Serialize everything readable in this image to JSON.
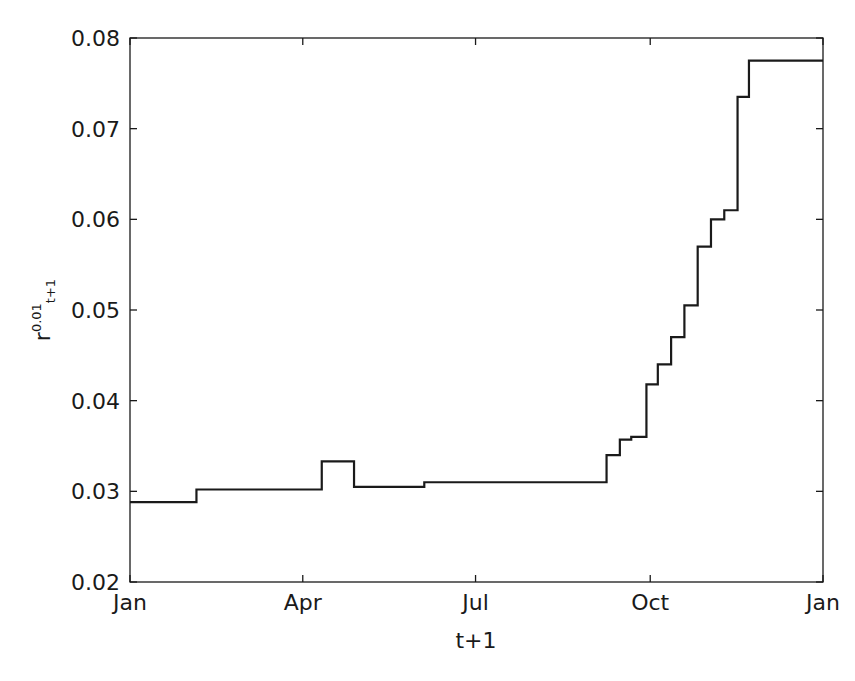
{
  "chart_data": {
    "type": "line",
    "title": "",
    "subtitle": "",
    "xlabel": "t+1",
    "ylabel": "r",
    "ylabel_superscript": "0.01",
    "ylabel_subscript": "t+1",
    "line_color": "#1a1a1a",
    "line_width": 2.2,
    "grid": false,
    "legend": null,
    "drawstyle": "steps-post",
    "xlim": [
      0,
      365
    ],
    "ylim": [
      0.02,
      0.08
    ],
    "xticks": [
      0,
      91,
      182,
      274,
      365
    ],
    "xticklabels": [
      "Jan",
      "Apr",
      "Jul",
      "Oct",
      "Jan"
    ],
    "yticks": [
      0.02,
      0.03,
      0.04,
      0.05,
      0.06,
      0.07,
      0.08
    ],
    "yticklabels": [
      "0.02",
      "0.03",
      "0.04",
      "0.05",
      "0.06",
      "0.07",
      "0.08"
    ],
    "x": [
      0,
      35,
      36,
      101,
      102,
      118,
      119,
      155,
      156,
      211,
      212,
      251,
      252,
      258,
      259,
      264,
      265,
      272,
      273,
      278,
      279,
      285,
      286,
      292,
      293,
      299,
      300,
      306,
      307,
      313,
      314,
      320,
      321,
      326,
      327,
      699
    ],
    "series": [
      {
        "name": "r^{0.01}_{t+1}",
        "values": [
          0.0288,
          0.0288,
          0.0302,
          0.0302,
          0.0333,
          0.0333,
          0.0305,
          0.0305,
          0.031,
          0.031,
          0.034,
          0.034,
          0.0357,
          0.0357,
          0.036,
          0.036,
          0.0418,
          0.0418,
          0.044,
          0.044,
          0.047,
          0.047,
          0.0505,
          0.0505,
          0.057,
          0.057,
          0.06,
          0.06,
          0.061,
          0.061,
          0.0735,
          0.0735,
          0.0775,
          0.0775,
          0.0775,
          0.0775
        ]
      }
    ],
    "steps": [
      {
        "x_start": 0,
        "x_end": 35,
        "value": 0.0288
      },
      {
        "x_start": 35,
        "x_end": 101,
        "value": 0.0302
      },
      {
        "x_start": 101,
        "x_end": 118,
        "value": 0.0333
      },
      {
        "x_start": 118,
        "x_end": 155,
        "value": 0.0305
      },
      {
        "x_start": 155,
        "x_end": 251,
        "value": 0.031
      },
      {
        "x_start": 251,
        "x_end": 258,
        "value": 0.034
      },
      {
        "x_start": 258,
        "x_end": 264,
        "value": 0.0357
      },
      {
        "x_start": 264,
        "x_end": 272,
        "value": 0.036
      },
      {
        "x_start": 272,
        "x_end": 278,
        "value": 0.0418
      },
      {
        "x_start": 278,
        "x_end": 285,
        "value": 0.044
      },
      {
        "x_start": 285,
        "x_end": 292,
        "value": 0.047
      },
      {
        "x_start": 292,
        "x_end": 299,
        "value": 0.0505
      },
      {
        "x_start": 299,
        "x_end": 306,
        "value": 0.057
      },
      {
        "x_start": 306,
        "x_end": 313,
        "value": 0.06
      },
      {
        "x_start": 313,
        "x_end": 320,
        "value": 0.061
      },
      {
        "x_start": 320,
        "x_end": 326,
        "value": 0.0735
      },
      {
        "x_start": 326,
        "x_end": 365,
        "value": 0.0775
      }
    ],
    "axes_box": {
      "left": 130,
      "top": 38,
      "right": 823,
      "bottom": 582,
      "color": "#1a1a1a"
    }
  }
}
